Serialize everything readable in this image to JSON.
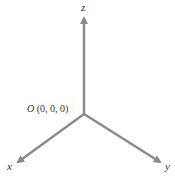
{
  "diagram": {
    "axes": [
      {
        "name": "x",
        "label": "x",
        "direction": "down-left"
      },
      {
        "name": "y",
        "label": "y",
        "direction": "down-right"
      },
      {
        "name": "z",
        "label": "z",
        "direction": "up"
      }
    ],
    "origin": {
      "letter": "O",
      "coords": " (0, 0, 0)"
    },
    "colors": {
      "axis": "#8a8a8a",
      "text": "#333333"
    }
  }
}
